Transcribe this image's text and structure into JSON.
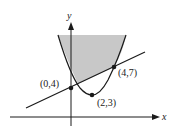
{
  "diagram": {
    "type": "region-between-curves",
    "axes": {
      "x_label": "x",
      "y_label": "y"
    },
    "curves": [
      {
        "name": "parabola",
        "equation": "y = (x-2)^2 + 3",
        "vertex": "(2,3)"
      },
      {
        "name": "line",
        "equation": "y = (3/4)x + 4"
      }
    ],
    "shaded_region": "above line, inside parabola",
    "points": [
      {
        "label": "(0,4)",
        "x": 0,
        "y": 4
      },
      {
        "label": "(2,3)",
        "x": 2,
        "y": 3
      },
      {
        "label": "(4,7)",
        "x": 4,
        "y": 7
      }
    ],
    "colors": {
      "shade": "#c8c8c8",
      "stroke": "#1a1a1a"
    }
  }
}
